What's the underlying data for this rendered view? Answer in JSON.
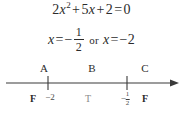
{
  "figure": {
    "background_color": "#ffffff",
    "ink_color": "#2b2b2b"
  },
  "equation": {
    "coefficient_a": "2",
    "variable": "x",
    "exponent": "2",
    "plus_1": "+",
    "coefficient_b": "5",
    "variable_b": "x",
    "plus_2": "+",
    "constant_c": "2",
    "equals": "=",
    "right_side": "0",
    "full_text": "2x^2 + 5x + 2 = 0"
  },
  "solutions": {
    "variable_1": "x",
    "equals_1": "=",
    "minus_1": "−",
    "fraction_numerator": "1",
    "fraction_denominator": "2",
    "conjunction": "or",
    "variable_2": "x",
    "equals_2": "=",
    "value_2": "−2",
    "full_text": "x = -1/2 or x = -2"
  },
  "number_line": {
    "axis_color": "#3a3a3a",
    "has_right_arrow": true,
    "regions": [
      {
        "label": "A",
        "x_percent": 24.0
      },
      {
        "label": "B",
        "x_percent": 50.3
      },
      {
        "label": "C",
        "x_percent": 79.0
      }
    ],
    "truth_values": [
      {
        "label": "F",
        "x_percent": 24.0,
        "muted": false
      },
      {
        "label": "T",
        "x_percent": 50.3,
        "muted": true
      },
      {
        "label": "F",
        "x_percent": 79.0,
        "muted": false
      }
    ],
    "ticks": [
      {
        "value": "−2",
        "x_percent": 26.2,
        "is_fraction": false
      },
      {
        "value": "-1/2",
        "x_percent": 69.4,
        "is_fraction": true,
        "sign": "−",
        "numerator": "1",
        "denominator": "2"
      }
    ]
  }
}
